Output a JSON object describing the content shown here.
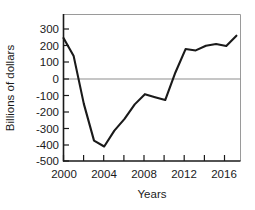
{
  "chart_data": {
    "type": "line",
    "title": "",
    "xlabel": "Years",
    "ylabel": "Billions of dollars",
    "xlim": [
      2000,
      2017.4
    ],
    "ylim": [
      -500,
      380
    ],
    "grid": false,
    "legend": "none",
    "zero_reference_line": true,
    "x_ticks_major": [
      2000,
      2004,
      2008,
      2012,
      2016
    ],
    "x_ticks_minor": [
      2002,
      2006,
      2010,
      2014
    ],
    "x_tick_labels": [
      "2000",
      "2004",
      "2008",
      "2012",
      "2016"
    ],
    "y_ticks": [
      300,
      200,
      100,
      0,
      -100,
      -200,
      -300,
      -400,
      -500
    ],
    "y_tick_labels": [
      "300",
      "200",
      "100",
      "0",
      "-100",
      "-200",
      "-300",
      "-400",
      "-500"
    ],
    "x": [
      2000,
      2001,
      2002,
      2003,
      2004,
      2005,
      2006,
      2007,
      2008,
      2009,
      2010,
      2011,
      2012,
      2013,
      2014,
      2015,
      2016,
      2017
    ],
    "values": [
      236,
      128,
      -158,
      -378,
      -413,
      -318,
      -248,
      -161,
      -100,
      -118,
      -135,
      30,
      170,
      162,
      190,
      200,
      188,
      250
    ],
    "series": [
      {
        "name": "Billions of dollars",
        "color": "#1a1a1a",
        "values": [
          236,
          128,
          -158,
          -378,
          -413,
          -318,
          -248,
          -161,
          -100,
          -118,
          -135,
          30,
          170,
          162,
          190,
          200,
          188,
          250
        ]
      }
    ],
    "zero_crossings": [
      2001.5,
      2011.3
    ]
  },
  "axis": {
    "y_title": "Billions of dollars",
    "x_title": "Years"
  }
}
